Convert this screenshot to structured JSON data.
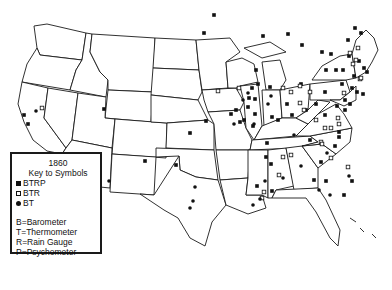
{
  "legend": {
    "year": "1860",
    "title": "Key to Symbols",
    "symbols": [
      {
        "shape": "filled-square",
        "label": "BTRP"
      },
      {
        "shape": "open-square",
        "label": "BTR"
      },
      {
        "shape": "filled-circle",
        "label": "BT"
      }
    ],
    "abbreviations": [
      "B=Barometer",
      "T=Thermometer",
      "R=Rain Gauge",
      "P=Psychometer"
    ]
  },
  "markers": {
    "BTRP": [
      [
        24,
        115
      ],
      [
        28,
        124
      ],
      [
        104,
        109
      ],
      [
        204,
        33
      ],
      [
        214,
        15
      ],
      [
        263,
        36
      ],
      [
        288,
        34
      ],
      [
        302,
        45
      ],
      [
        256,
        70
      ],
      [
        258,
        84
      ],
      [
        252,
        88
      ],
      [
        270,
        87
      ],
      [
        249,
        98
      ],
      [
        255,
        99
      ],
      [
        248,
        107
      ],
      [
        244,
        120
      ],
      [
        255,
        114
      ],
      [
        253,
        126
      ],
      [
        301,
        84
      ],
      [
        322,
        52
      ],
      [
        331,
        54
      ],
      [
        336,
        70
      ],
      [
        343,
        70
      ],
      [
        348,
        40
      ],
      [
        355,
        28
      ],
      [
        361,
        33
      ],
      [
        349,
        56
      ],
      [
        364,
        68
      ],
      [
        367,
        72
      ],
      [
        352,
        88
      ],
      [
        357,
        92
      ],
      [
        363,
        94
      ],
      [
        342,
        84
      ],
      [
        345,
        100
      ],
      [
        350,
        104
      ],
      [
        206,
        121
      ],
      [
        190,
        133
      ],
      [
        145,
        161
      ],
      [
        176,
        165
      ],
      [
        267,
        143
      ],
      [
        271,
        164
      ],
      [
        314,
        180
      ],
      [
        335,
        146
      ],
      [
        321,
        162
      ],
      [
        326,
        181
      ],
      [
        344,
        195
      ],
      [
        352,
        181
      ],
      [
        266,
        157
      ],
      [
        257,
        186
      ],
      [
        272,
        191
      ],
      [
        231,
        114
      ],
      [
        236,
        110
      ],
      [
        240,
        122
      ],
      [
        272,
        117
      ],
      [
        278,
        120
      ],
      [
        292,
        115
      ],
      [
        287,
        104
      ],
      [
        306,
        110
      ],
      [
        316,
        104
      ],
      [
        325,
        92
      ],
      [
        337,
        106
      ],
      [
        345,
        110
      ],
      [
        354,
        76
      ],
      [
        359,
        61
      ],
      [
        326,
        70
      ],
      [
        339,
        132
      ],
      [
        339,
        137
      ],
      [
        310,
        140
      ],
      [
        325,
        115
      ]
    ],
    "BTR": [
      [
        42,
        108
      ],
      [
        218,
        91
      ],
      [
        239,
        88
      ],
      [
        283,
        88
      ],
      [
        291,
        92
      ],
      [
        300,
        86
      ],
      [
        310,
        92
      ],
      [
        300,
        103
      ],
      [
        304,
        110
      ],
      [
        316,
        120
      ],
      [
        325,
        128
      ],
      [
        331,
        128
      ],
      [
        350,
        53
      ],
      [
        356,
        60
      ],
      [
        358,
        48
      ],
      [
        353,
        64
      ],
      [
        360,
        79
      ],
      [
        344,
        93
      ],
      [
        338,
        118
      ],
      [
        339,
        124
      ],
      [
        283,
        157
      ],
      [
        279,
        175
      ],
      [
        348,
        167
      ],
      [
        264,
        192
      ],
      [
        262,
        198
      ],
      [
        331,
        158
      ],
      [
        291,
        155
      ],
      [
        361,
        78
      ],
      [
        321,
        142
      ],
      [
        322,
        144
      ]
    ],
    "BT": [
      [
        36,
        111
      ],
      [
        109,
        181
      ],
      [
        195,
        187
      ],
      [
        190,
        208
      ],
      [
        193,
        201
      ],
      [
        283,
        178
      ],
      [
        301,
        166
      ],
      [
        319,
        190
      ],
      [
        349,
        176
      ],
      [
        327,
        153
      ],
      [
        265,
        181
      ],
      [
        260,
        199
      ],
      [
        253,
        205
      ],
      [
        294,
        135
      ],
      [
        254,
        124
      ],
      [
        234,
        124
      ],
      [
        248,
        93
      ],
      [
        243,
        100
      ],
      [
        330,
        195
      ],
      [
        268,
        104
      ],
      [
        271,
        96
      ]
    ]
  }
}
